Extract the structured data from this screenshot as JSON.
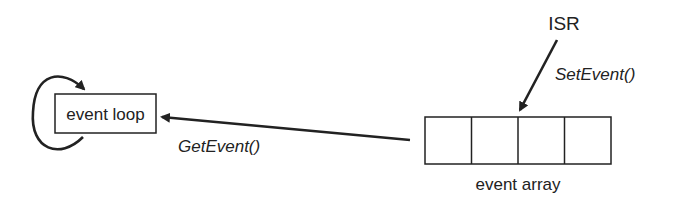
{
  "diagram": {
    "nodes": {
      "event_loop": {
        "label": "event loop"
      },
      "event_array": {
        "label": "event array",
        "cells": 4
      },
      "isr": {
        "label": "ISR"
      }
    },
    "edges": {
      "set_event": {
        "from": "ISR",
        "to": "event array",
        "label": "SetEvent()"
      },
      "get_event": {
        "from": "event array",
        "to": "event loop",
        "label": "GetEvent()"
      },
      "loop": {
        "from": "event loop",
        "to": "event loop",
        "label": ""
      }
    },
    "colors": {
      "stroke": "#222222",
      "background": "#ffffff"
    }
  }
}
